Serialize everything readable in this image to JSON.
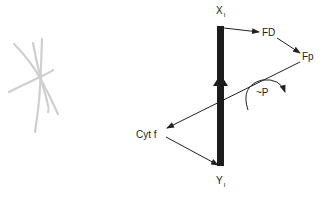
{
  "diagram": {
    "nodes": {
      "x_i": {
        "label": "X",
        "subscript": "I"
      },
      "y_i": {
        "label": "Y",
        "subscript": "I"
      },
      "fd": {
        "label": "FD"
      },
      "fp": {
        "label": "Fp"
      },
      "cyt_f": {
        "label": "Cyt f"
      },
      "phosphorylation": {
        "label": "~P"
      }
    },
    "edges": [
      {
        "from": "X_I",
        "to": "FD"
      },
      {
        "from": "FD",
        "to": "Fp"
      },
      {
        "from": "Fp",
        "to": "Cyt f"
      },
      {
        "from": "Cyt f",
        "to": "Y_I"
      },
      {
        "from": "Y_I",
        "to": "X_I",
        "style": "thick-bar"
      }
    ],
    "colors": {
      "ink": "#222222",
      "sketch": "#c8c8c8"
    }
  }
}
